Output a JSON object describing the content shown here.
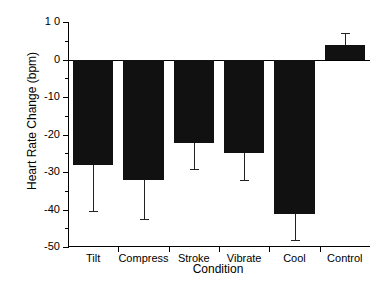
{
  "chart_data": {
    "type": "bar",
    "title": "",
    "xlabel": "Condition",
    "ylabel": "Heart Rate Change (bpm)",
    "categories": [
      "Tilt",
      "Compress",
      "Stroke",
      "Vibrate",
      "Cool",
      "Control"
    ],
    "values": [
      -28.2,
      -32.0,
      -22.3,
      -24.8,
      -41.2,
      3.8
    ],
    "errors": [
      12.1,
      10.5,
      6.9,
      7.2,
      6.8,
      3.2
    ],
    "error_type": "one-sided-outward",
    "ylim": [
      -50,
      10
    ],
    "yticks": [
      10,
      0,
      -10,
      -20,
      -30,
      -40,
      -50
    ],
    "ytick_labels": [
      "1 0",
      "0",
      "-10",
      "-20",
      "-30",
      "-40",
      "-50"
    ],
    "minor_tick_step": 5,
    "grid": false,
    "legend": null,
    "bar_color": "#111111",
    "axis_color": "#000000",
    "series": [
      {
        "name": "Heart Rate Change",
        "values": [
          -28.2,
          -32.0,
          -22.3,
          -24.8,
          -41.2,
          3.8
        ]
      }
    ]
  }
}
